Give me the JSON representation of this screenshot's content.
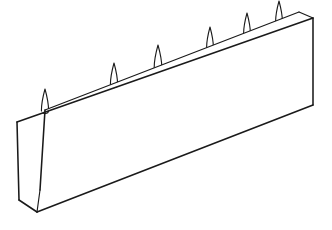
{
  "figure": {
    "style": "black-and-white technical line art",
    "background_color": "#ffffff",
    "line_color": "#1a1a1a",
    "fill_color": "#ffffff",
    "object_name": "spiked-board",
    "projection": "oblique-isometric",
    "units": "pixels",
    "canvas": {
      "width": 332,
      "height": 230
    }
  },
  "geometry": {
    "vertices": {
      "back_top_left": {
        "x": 45,
        "y": 110
      },
      "back_top_right": {
        "x": 299,
        "y": 12
      },
      "front_top_left": {
        "x": 17,
        "y": 122
      },
      "front_top_right": {
        "x": 313,
        "y": 18
      },
      "front_bot_left": {
        "x": 37,
        "y": 212
      },
      "front_bot_right": {
        "x": 313,
        "y": 105
      },
      "left_bot_back": {
        "x": 19,
        "y": 200
      },
      "left_top_back": {
        "x": 17,
        "y": 122
      },
      "left_top_front": {
        "x": 45,
        "y": 110
      },
      "left_bot_front": {
        "x": 40,
        "y": 190
      }
    },
    "paths": {
      "top_face": "M 17 122 L 45 110 L 299 12 L 313 18 Z",
      "front_face": "M 45 110 L 299 12 L 313 18 L 313 105 L 37 212 L 40 190 Z",
      "left_end_face": "M 17 122 L 45 110 L 40 190 L 19 200 Z",
      "back_top_edge": "M 45 110 L 299 12",
      "front_top_edge": "M 17 122 L 313 18",
      "front_bottom_edge": "M 37 212 L 313 105",
      "right_vertical_edge": "M 313 18 L 313 105",
      "right_corner_edge": "M 299 12 L 313 18",
      "left_outer_vertical": "M 17 122 L 19 200",
      "left_inner_vertical": "M 45 110 L 40 190",
      "left_bottom_edge": "M 19 200 L 37 212",
      "left_bottom_inner": "M 40 190 L 37 212"
    }
  },
  "spikes": {
    "count": 6,
    "shape": "elongated-teardrop-point",
    "items": [
      {
        "id": "spike-1",
        "base_x": 45,
        "base_y": 110,
        "height": 24,
        "half_width": 3.6
      },
      {
        "id": "spike-2",
        "base_x": 114,
        "base_y": 84,
        "height": 24,
        "half_width": 3.6
      },
      {
        "id": "spike-3",
        "base_x": 158,
        "base_y": 67,
        "height": 25,
        "half_width": 3.8
      },
      {
        "id": "spike-4",
        "base_x": 210,
        "base_y": 47,
        "height": 23,
        "half_width": 3.4
      },
      {
        "id": "spike-5",
        "base_x": 247,
        "base_y": 33,
        "height": 23,
        "half_width": 3.4
      },
      {
        "id": "spike-6",
        "base_x": 279,
        "base_y": 21,
        "height": 23,
        "half_width": 3.4
      }
    ]
  }
}
